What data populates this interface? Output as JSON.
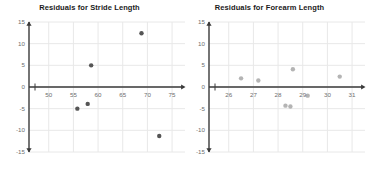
{
  "chart_data": [
    {
      "type": "scatter",
      "title": "Residuals for Stride Length",
      "xlabel": "",
      "ylabel": "",
      "xlim": [
        46,
        76
      ],
      "ylim": [
        -15,
        15
      ],
      "xticks": [
        50,
        55,
        60,
        65,
        70,
        75
      ],
      "yticks": [
        15,
        10,
        5,
        0,
        -5,
        -10,
        -15
      ],
      "xtick_labels": [
        "50",
        "55",
        "60",
        "65",
        "70",
        "75"
      ],
      "ytick_labels": [
        "15",
        "10",
        "5",
        "0",
        "-5",
        "-10",
        "-15"
      ],
      "grid": true,
      "legend": "none",
      "point_color": "#555555",
      "points": [
        {
          "x": 68.8,
          "y": 12.4
        },
        {
          "x": 58.6,
          "y": 5.0
        },
        {
          "x": 55.8,
          "y": -5.0
        },
        {
          "x": 57.9,
          "y": -3.9
        },
        {
          "x": 72.4,
          "y": -11.3
        }
      ]
    },
    {
      "type": "scatter",
      "title": "Residuals for Forearm Length",
      "xlabel": "",
      "ylabel": "",
      "xlim": [
        25.2,
        31.2
      ],
      "ylim": [
        -15,
        15
      ],
      "xticks": [
        26,
        27,
        28,
        29,
        30,
        31
      ],
      "yticks": [
        15,
        10,
        5,
        0,
        -5,
        -10,
        -15
      ],
      "xtick_labels": [
        "26",
        "27",
        "28",
        "29",
        "30",
        "31"
      ],
      "ytick_labels": [
        "15",
        "10",
        "5",
        "0",
        "-5",
        "-10",
        "-15"
      ],
      "grid": true,
      "legend": "none",
      "point_color": "#b4b4b4",
      "points": [
        {
          "x": 26.5,
          "y": 2.0
        },
        {
          "x": 27.2,
          "y": 1.5
        },
        {
          "x": 28.6,
          "y": 4.1
        },
        {
          "x": 29.2,
          "y": -2.0
        },
        {
          "x": 28.3,
          "y": -4.3
        },
        {
          "x": 28.5,
          "y": -4.5
        },
        {
          "x": 30.5,
          "y": 2.4
        }
      ]
    }
  ],
  "axis": {
    "arrow_color": "#3a3a3a",
    "grid_color": "#e8e8e8"
  }
}
